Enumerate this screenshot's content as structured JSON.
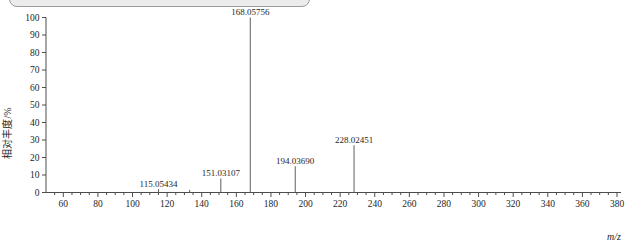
{
  "figure": {
    "background": "#ffffff",
    "top_control": {
      "type": "horizontal-scrollbar-thumb",
      "partially_cropped": true
    }
  },
  "chart_data": {
    "type": "bar",
    "chart_kind": "mass-spectrum",
    "title": "",
    "xlabel": "m/z",
    "ylabel": "相对丰度/%",
    "xlim": [
      50,
      380
    ],
    "ylim": [
      0,
      100
    ],
    "x_ticks": [
      60,
      80,
      100,
      120,
      140,
      160,
      180,
      200,
      220,
      240,
      260,
      280,
      300,
      320,
      340,
      360,
      380
    ],
    "x_minor_tick_step": 5,
    "y_ticks": [
      0,
      10,
      20,
      30,
      40,
      50,
      60,
      70,
      80,
      90,
      100
    ],
    "grid": false,
    "legend": false,
    "peaks": [
      {
        "mz": 115.05434,
        "intensity": 2,
        "label": "115.05434"
      },
      {
        "mz": 133.0,
        "intensity": 1.5,
        "label": ""
      },
      {
        "mz": 151.03107,
        "intensity": 8,
        "label": "151.03107"
      },
      {
        "mz": 168.05756,
        "intensity": 100,
        "label": "168.05756"
      },
      {
        "mz": 194.0369,
        "intensity": 15,
        "label": "194.03690"
      },
      {
        "mz": 228.02451,
        "intensity": 27,
        "label": "228.02451"
      }
    ],
    "colors": {
      "axis": "#4d4d4d",
      "peak": "#5e5e5e",
      "text": "#262626",
      "scrollbar_fill": "#ececec",
      "scrollbar_border": "#9b9b9b"
    }
  }
}
